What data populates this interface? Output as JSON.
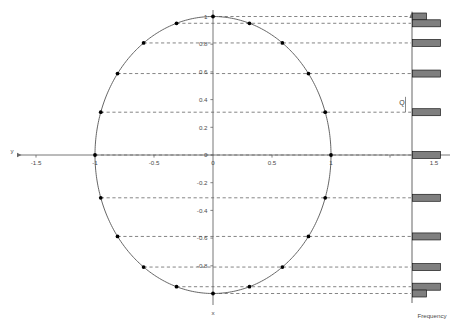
{
  "figure": {
    "axis_x_name": "x",
    "axis_y_name": "y",
    "frequency_label": "Frequency",
    "q_label": "Q",
    "colors": {
      "curve": "#555555",
      "point": "#000000",
      "dashed": "#333333",
      "axis": "#666666",
      "bar_fill": "#7f7f7f",
      "bar_stroke": "#1a1a1a",
      "text": "#4a4a4a",
      "background": "#ffffff"
    }
  },
  "chart_data": {
    "type": "scatter",
    "title": "",
    "xlabel": "x",
    "ylabel": "y",
    "xlim": [
      -1.5,
      1.5
    ],
    "ylim": [
      -1.05,
      1.05
    ],
    "grid": false,
    "x_ticks": [
      -1.5,
      -1,
      -0.5,
      0,
      0.5,
      1,
      1.5
    ],
    "x_tick_labels": [
      "-1.5",
      "-1",
      "-0.5",
      "0",
      "0.5",
      "1",
      "1.5"
    ],
    "y_ticks": [
      1,
      0.8,
      0.6,
      0.4,
      0.2,
      0,
      -0.2,
      -0.4,
      -0.6,
      -0.8,
      -1
    ],
    "y_tick_labels": [
      "1",
      "0.8",
      "0.6",
      "0.4",
      "0.2",
      "0",
      "-0.2",
      "-0.4",
      "-0.6",
      "-0.8",
      "-1"
    ],
    "curve_name": "unit-circle",
    "curve_radius": 1,
    "points_x": [
      0.0,
      0.309,
      0.588,
      0.809,
      0.951,
      1.0,
      0.951,
      0.809,
      0.588,
      0.309,
      0.0,
      -0.309,
      -0.588,
      -0.809,
      -0.951,
      -1.0,
      -0.951,
      -0.809,
      -0.588,
      -0.309
    ],
    "points_y": [
      1.0,
      0.951,
      0.809,
      0.588,
      0.309,
      0.0,
      -0.309,
      -0.588,
      -0.809,
      -0.951,
      -1.0,
      -0.951,
      -0.809,
      -0.588,
      -0.309,
      0.0,
      0.309,
      0.588,
      0.809,
      0.951
    ],
    "dashed_levels": [
      1.0,
      0.951,
      0.809,
      0.588,
      0.309,
      0.0,
      -0.309,
      -0.588,
      -0.809,
      -0.951,
      -1.0
    ],
    "histogram": {
      "orientation": "horizontal",
      "axis_label": "Frequency",
      "levels": [
        1.0,
        0.951,
        0.809,
        0.588,
        0.309,
        0.0,
        -0.309,
        -0.588,
        -0.809,
        -0.951,
        -1.0
      ],
      "counts": [
        1,
        2,
        2,
        2,
        2,
        2,
        2,
        2,
        2,
        2,
        1
      ]
    }
  }
}
